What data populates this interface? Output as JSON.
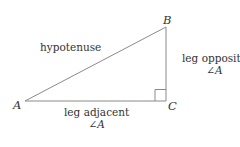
{
  "diagram": {
    "background_color": "#ffffff",
    "stroke_color": "#8a8a8a",
    "text_color": "#333333",
    "vertices": {
      "A": {
        "label": "A",
        "x": 25,
        "y": 101
      },
      "B": {
        "label": "B",
        "x": 166,
        "y": 27
      },
      "C": {
        "label": "C",
        "x": 166,
        "y": 101
      }
    },
    "right_angle": {
      "at_vertex": "C",
      "marker": "square",
      "size": 11
    },
    "labels": {
      "hypotenuse": "hypotenuse",
      "leg_opposite_line1": "leg opposite",
      "leg_opposite_line2": "∠A",
      "leg_adjacent_line1": "leg adjacent",
      "leg_adjacent_line2": "∠A",
      "angle_symbol": "∠",
      "angle_name": "A"
    }
  }
}
